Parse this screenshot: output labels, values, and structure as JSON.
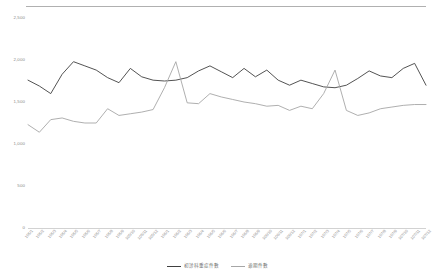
{
  "chart_data": {
    "type": "line",
    "title": "",
    "xlabel": "",
    "ylabel": "",
    "ylim": [
      0,
      2500
    ],
    "yticks": [
      "0",
      "500",
      "1,000",
      "1,500",
      "2,000",
      "2,500"
    ],
    "ytick_values": [
      0,
      500,
      1000,
      1500,
      2000,
      2500
    ],
    "grid": false,
    "legend_position": "bottom-center",
    "categories": [
      "105/1",
      "105/2",
      "105/3",
      "105/4",
      "105/5",
      "105/6",
      "105/7",
      "105/8",
      "105/9",
      "105/10",
      "105/11",
      "105/12",
      "106/1",
      "106/2",
      "106/3",
      "106/4",
      "106/5",
      "106/6",
      "106/7",
      "106/8",
      "106/9",
      "106/10",
      "106/11",
      "106/12",
      "107/1",
      "107/2",
      "107/3",
      "107/4",
      "107/5",
      "107/6",
      "107/7",
      "107/8",
      "107/9",
      "107/10",
      "107/11",
      "107/12"
    ],
    "series": [
      {
        "name": "初診科重症件數",
        "color": "#404040",
        "values": [
          1760,
          1690,
          1600,
          1830,
          1980,
          1930,
          1880,
          1790,
          1730,
          1900,
          1800,
          1760,
          1750,
          1760,
          1790,
          1870,
          1930,
          1860,
          1790,
          1900,
          1800,
          1880,
          1760,
          1700,
          1760,
          1720,
          1680,
          1670,
          1700,
          1780,
          1870,
          1810,
          1790,
          1900,
          1960,
          1700
        ]
      },
      {
        "name": "逾期件數",
        "color": "#a6a6a6",
        "values": [
          1230,
          1140,
          1290,
          1310,
          1270,
          1250,
          1250,
          1420,
          1340,
          1360,
          1380,
          1410,
          1670,
          1980,
          1490,
          1480,
          1600,
          1560,
          1530,
          1500,
          1480,
          1450,
          1460,
          1400,
          1450,
          1420,
          1600,
          1880,
          1400,
          1340,
          1370,
          1420,
          1440,
          1460,
          1470,
          1470
        ]
      }
    ]
  },
  "legend": {
    "items": [
      {
        "label": "初診科重症件數"
      },
      {
        "label": "逾期件數"
      }
    ]
  }
}
